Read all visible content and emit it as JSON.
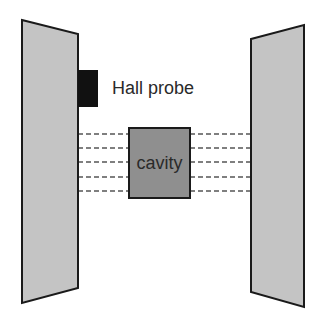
{
  "diagram": {
    "labels": {
      "hall_probe": "Hall probe",
      "cavity": "cavity"
    },
    "colors": {
      "plate_fill": "#c4c4c4",
      "plate_stroke": "#1a1a1a",
      "probe_fill": "#111111",
      "cavity_fill": "#8f8f8f",
      "field_line": "#555555",
      "background": "#ffffff"
    },
    "field_lines_count": 5
  }
}
